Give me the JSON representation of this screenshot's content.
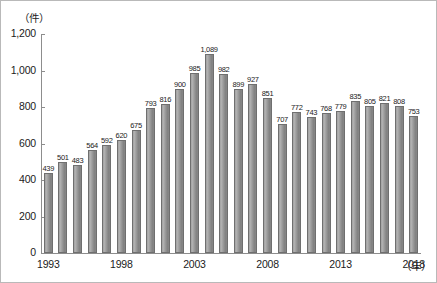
{
  "chart_data": {
    "type": "bar",
    "title": "",
    "xlabel": "年",
    "ylabel": "件",
    "unit_caption": "（件）",
    "xaxis_unit_suffix": "（年）",
    "ylim": [
      0,
      1200
    ],
    "ytick_step": 200,
    "yticks": [
      "0",
      "200",
      "400",
      "600",
      "800",
      "1,000",
      "1,200"
    ],
    "ytick_values": [
      0,
      200,
      400,
      600,
      800,
      1000,
      1200
    ],
    "grid": false,
    "legend": "none",
    "categories": [
      "1993",
      "1994",
      "1995",
      "1996",
      "1997",
      "1998",
      "1999",
      "2000",
      "2001",
      "2002",
      "2003",
      "2004",
      "2005",
      "2006",
      "2007",
      "2008",
      "2009",
      "2010",
      "2011",
      "2012",
      "2013",
      "2014",
      "2015",
      "2016",
      "2017",
      "2018"
    ],
    "values": [
      439,
      501,
      483,
      564,
      592,
      620,
      675,
      793,
      816,
      900,
      985,
      1089,
      982,
      899,
      927,
      851,
      707,
      772,
      743,
      768,
      779,
      835,
      805,
      821,
      808,
      753
    ],
    "data_labels": [
      "439",
      "501",
      "483",
      "564",
      "592",
      "620",
      "675",
      "793",
      "816",
      "900",
      "985",
      "1,089",
      "982",
      "899",
      "927",
      "851",
      "707",
      "772",
      "743",
      "768",
      "779",
      "835",
      "805",
      "821",
      "808",
      "753"
    ],
    "xtick_labels": [
      "1993",
      "1998",
      "2003",
      "2008",
      "2013",
      "2018"
    ],
    "xtick_categories": [
      "1993",
      "1998",
      "2003",
      "2008",
      "2013",
      "2018"
    ],
    "colors": {
      "bar_fill": "#9a9a9a",
      "bar_border": "#6f6f6f",
      "axis": "#8d8d8d",
      "text": "#1b1b1b",
      "background": "#ffffff",
      "frame": "#b9b9b9"
    }
  }
}
